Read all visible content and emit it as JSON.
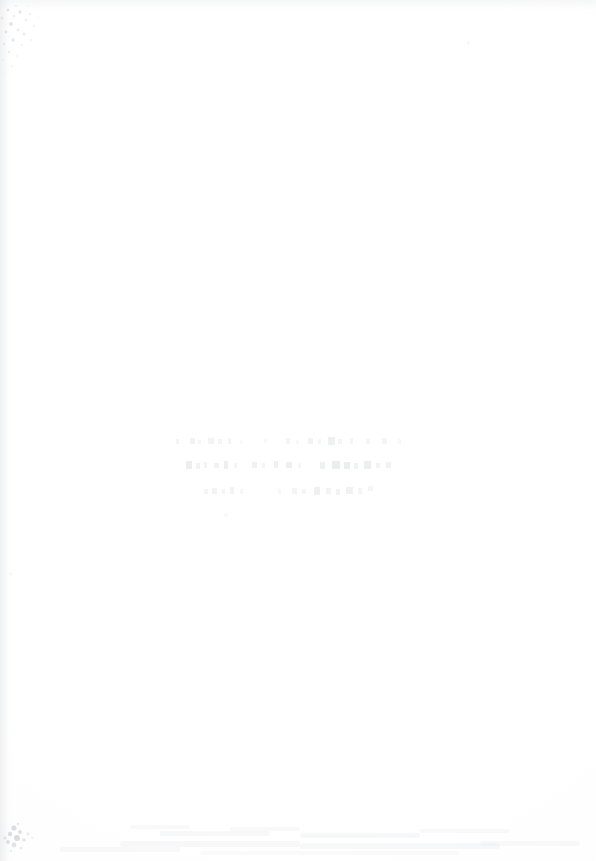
{
  "document": {
    "kind": "scanned-page",
    "page_state": "blank",
    "background_color": "#ffffff",
    "width": 596,
    "height": 861,
    "legible_text": "",
    "note_visible_on_page": ""
  },
  "stamp": {
    "present": true,
    "legible": false,
    "line_count": 3,
    "region": {
      "left": 168,
      "top": 432,
      "width": 264,
      "height": 86
    },
    "lines": [
      {
        "id": "line-1",
        "text": "",
        "legible": false
      },
      {
        "id": "line-2",
        "text": "",
        "legible": false
      },
      {
        "id": "line-3",
        "text": "",
        "legible": false
      }
    ]
  },
  "artifacts": {
    "ink_color": "#787c82",
    "items": [
      {
        "id": "speckle-top-left",
        "label": "",
        "kind": "scanner-speckle"
      },
      {
        "id": "smudge-bottom-band",
        "label": "",
        "kind": "smudge"
      },
      {
        "id": "mark-bottom-left",
        "label": "",
        "kind": "ink-mark"
      },
      {
        "id": "speck-top-right",
        "label": "",
        "kind": "speck"
      },
      {
        "id": "speck-below-stamp",
        "label": "",
        "kind": "speck"
      }
    ]
  }
}
